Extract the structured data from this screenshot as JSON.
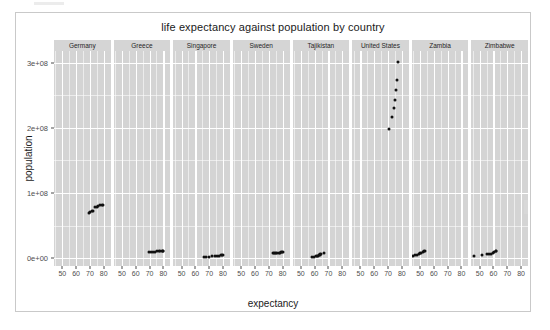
{
  "chart_data": {
    "type": "scatter",
    "title": "life expectancy against population by country",
    "xlabel": "expectancy",
    "ylabel": "population",
    "facet_variable": "country",
    "grid": true,
    "legend": "none",
    "xlim": [
      44,
      85
    ],
    "ylim": [
      -12000000,
      318000000
    ],
    "xticks": [
      50,
      60,
      70,
      80
    ],
    "xticklabels": [
      "50",
      "60",
      "70",
      "80"
    ],
    "yticks": [
      0,
      100000000,
      200000000,
      300000000
    ],
    "yticklabels": [
      "0e+00",
      "1e+08",
      "2e+08",
      "3e+08"
    ],
    "facets": [
      {
        "label": "Germany",
        "points": [
          {
            "x": 69.1,
            "y": 69000000
          },
          {
            "x": 70.4,
            "y": 71000000
          },
          {
            "x": 71.5,
            "y": 72000000
          },
          {
            "x": 72.6,
            "y": 73000000
          },
          {
            "x": 73.8,
            "y": 78000000
          },
          {
            "x": 75.2,
            "y": 79000000
          },
          {
            "x": 76.1,
            "y": 80000000
          },
          {
            "x": 77.3,
            "y": 81000000
          },
          {
            "x": 78.7,
            "y": 82000000
          },
          {
            "x": 79.4,
            "y": 82400000
          }
        ]
      },
      {
        "label": "Greece",
        "points": [
          {
            "x": 69.5,
            "y": 8900000
          },
          {
            "x": 71.0,
            "y": 9400000
          },
          {
            "x": 72.3,
            "y": 9800000
          },
          {
            "x": 73.7,
            "y": 10200000
          },
          {
            "x": 75.2,
            "y": 10500000
          },
          {
            "x": 76.7,
            "y": 10700000
          },
          {
            "x": 77.8,
            "y": 10900000
          },
          {
            "x": 78.9,
            "y": 11000000
          },
          {
            "x": 79.5,
            "y": 11100000
          },
          {
            "x": 80.1,
            "y": 11200000
          }
        ]
      },
      {
        "label": "Singapore",
        "points": [
          {
            "x": 66.0,
            "y": 1800000
          },
          {
            "x": 68.0,
            "y": 2100000
          },
          {
            "x": 70.0,
            "y": 2400000
          },
          {
            "x": 72.0,
            "y": 2700000
          },
          {
            "x": 74.0,
            "y": 3100000
          },
          {
            "x": 75.8,
            "y": 3500000
          },
          {
            "x": 77.2,
            "y": 3900000
          },
          {
            "x": 78.5,
            "y": 4200000
          },
          {
            "x": 79.5,
            "y": 4500000
          },
          {
            "x": 80.0,
            "y": 4800000
          }
        ]
      },
      {
        "label": "Sweden",
        "points": [
          {
            "x": 73.0,
            "y": 7500000
          },
          {
            "x": 74.0,
            "y": 7800000
          },
          {
            "x": 74.7,
            "y": 8100000
          },
          {
            "x": 75.4,
            "y": 8300000
          },
          {
            "x": 76.3,
            "y": 8500000
          },
          {
            "x": 77.4,
            "y": 8600000
          },
          {
            "x": 78.2,
            "y": 8700000
          },
          {
            "x": 79.0,
            "y": 8800000
          },
          {
            "x": 79.8,
            "y": 8900000
          },
          {
            "x": 80.5,
            "y": 9100000
          }
        ]
      },
      {
        "label": "Tajikistan",
        "points": [
          {
            "x": 58.0,
            "y": 2100000
          },
          {
            "x": 59.5,
            "y": 2600000
          },
          {
            "x": 60.8,
            "y": 3000000
          },
          {
            "x": 61.9,
            "y": 3500000
          },
          {
            "x": 62.7,
            "y": 4000000
          },
          {
            "x": 63.2,
            "y": 4700000
          },
          {
            "x": 63.6,
            "y": 5300000
          },
          {
            "x": 63.9,
            "y": 5800000
          },
          {
            "x": 64.3,
            "y": 6200000
          },
          {
            "x": 66.8,
            "y": 7300000
          }
        ]
      },
      {
        "label": "United States",
        "points": [
          {
            "x": 70.8,
            "y": 198000000
          },
          {
            "x": 72.6,
            "y": 216000000
          },
          {
            "x": 74.0,
            "y": 231000000
          },
          {
            "x": 75.3,
            "y": 243000000
          },
          {
            "x": 76.1,
            "y": 258000000
          },
          {
            "x": 76.8,
            "y": 273000000
          },
          {
            "x": 77.3,
            "y": 301000000
          }
        ]
      },
      {
        "label": "Zambia",
        "points": [
          {
            "x": 45.0,
            "y": 3500000
          },
          {
            "x": 46.5,
            "y": 4800000
          },
          {
            "x": 48.0,
            "y": 5300000
          },
          {
            "x": 49.0,
            "y": 6600000
          },
          {
            "x": 50.1,
            "y": 7300000
          },
          {
            "x": 51.0,
            "y": 8400000
          },
          {
            "x": 51.8,
            "y": 9500000
          },
          {
            "x": 52.8,
            "y": 10600000
          },
          {
            "x": 53.5,
            "y": 11700000
          }
        ]
      },
      {
        "label": "Zimbabwe",
        "points": [
          {
            "x": 46.0,
            "y": 4100000
          },
          {
            "x": 52.0,
            "y": 5100000
          },
          {
            "x": 55.0,
            "y": 5800000
          },
          {
            "x": 56.5,
            "y": 6300000
          },
          {
            "x": 58.0,
            "y": 7100000
          },
          {
            "x": 59.5,
            "y": 8200000
          },
          {
            "x": 60.5,
            "y": 9400000
          },
          {
            "x": 61.5,
            "y": 10600000
          },
          {
            "x": 62.0,
            "y": 11700000
          }
        ]
      }
    ]
  },
  "style": {
    "panel_fill": "#d4d4d4",
    "strip_fill": "#d5d5d5",
    "gridline_color": "#ffffff",
    "point_color": "#111111",
    "text_color": "#1a1a1a",
    "axis_text_color": "#4d4d4d",
    "page_background": "#ffffff"
  }
}
